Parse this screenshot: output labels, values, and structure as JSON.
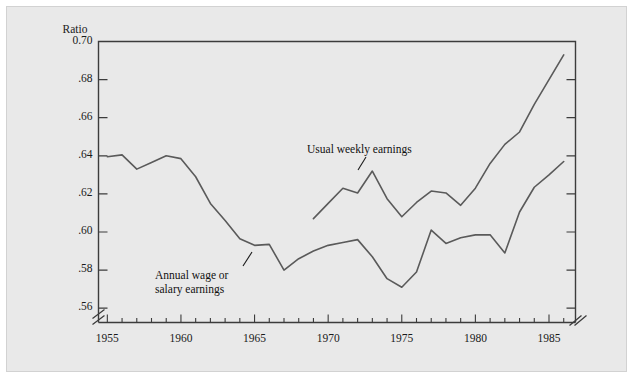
{
  "figure": {
    "background_color": "#ffffff",
    "panel_color": "#e9e9e8",
    "panel_border_color": "#d2d2d2",
    "line_color": "#5a5a5a",
    "axis_color": "#3c3c3c",
    "text_color": "#1a1a1a"
  },
  "axis": {
    "y_title": "Ratio",
    "y_ticks": [
      "0.70",
      ".68",
      ".66",
      ".64",
      ".62",
      ".60",
      ".58",
      ".56"
    ],
    "y_tick_values": [
      0.7,
      0.68,
      0.66,
      0.64,
      0.62,
      0.6,
      0.58,
      0.56
    ],
    "x_ticks": [
      "1955",
      "1960",
      "1965",
      "1970",
      "1975",
      "1980",
      "1985"
    ],
    "x_tick_values": [
      1955,
      1960,
      1965,
      1970,
      1975,
      1980,
      1985
    ],
    "y_axis_break": true,
    "x_axis_break": true,
    "x_minor_tick_interval": 1
  },
  "annotations": {
    "weekly": {
      "line1": "Usual weekly earnings",
      "line2": ""
    },
    "annual": {
      "line1": "Annual wage or",
      "line2": "salary earnings"
    }
  },
  "chart_data": {
    "type": "line",
    "title": "",
    "xlabel": "",
    "ylabel": "Ratio",
    "xlim": [
      1954.4,
      1986.8
    ],
    "ylim": [
      0.5525,
      0.7
    ],
    "grid": false,
    "legend": "inline-annotations",
    "series": [
      {
        "name": "Annual wage or salary earnings",
        "x": [
          1955,
          1956,
          1957,
          1958,
          1959,
          1960,
          1961,
          1962,
          1963,
          1964,
          1965,
          1966,
          1967,
          1968,
          1969,
          1970,
          1971,
          1972,
          1973,
          1974,
          1975,
          1976,
          1977,
          1978,
          1979,
          1980,
          1981,
          1982,
          1983,
          1984,
          1985,
          1986
        ],
        "values": [
          0.6395,
          0.6405,
          0.633,
          0.6365,
          0.64,
          0.6385,
          0.629,
          0.615,
          0.606,
          0.5965,
          0.593,
          0.5935,
          0.58,
          0.586,
          0.59,
          0.593,
          0.5945,
          0.596,
          0.587,
          0.5755,
          0.571,
          0.579,
          0.601,
          0.594,
          0.597,
          0.5985,
          0.5985,
          0.589,
          0.6105,
          0.6235,
          0.63,
          0.637
        ]
      },
      {
        "name": "Usual weekly earnings",
        "x": [
          1969,
          1970,
          1971,
          1972,
          1973,
          1974,
          1975,
          1976,
          1977,
          1978,
          1979,
          1980,
          1981,
          1982,
          1983,
          1984,
          1985,
          1986
        ],
        "values": [
          0.607,
          0.615,
          0.623,
          0.6205,
          0.632,
          0.6175,
          0.608,
          0.6155,
          0.6215,
          0.6205,
          0.614,
          0.623,
          0.636,
          0.646,
          0.6525,
          0.667,
          0.68,
          0.693
        ]
      }
    ]
  }
}
